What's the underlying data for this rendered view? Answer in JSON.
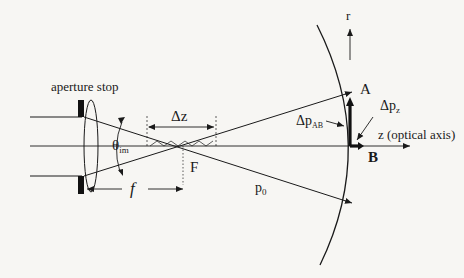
{
  "diagram": {
    "type": "optical-schematic",
    "labels": {
      "aperture_stop": "aperture stop",
      "theta": "θ",
      "theta_sub": "im",
      "delta_z": "Δz",
      "focal_point": "F",
      "focal_length": "f",
      "p0": "p",
      "p0_sub": "0",
      "delta_p_ab": "Δp",
      "delta_p_ab_sub": "AB",
      "delta_p_z": "Δp",
      "delta_p_z_sub": "z",
      "point_a": "A",
      "point_b": "B",
      "r_axis": "r",
      "z_axis": "z (optical axis)"
    },
    "colors": {
      "background": "#f7f6f3",
      "ink": "#1a1a1a"
    }
  }
}
